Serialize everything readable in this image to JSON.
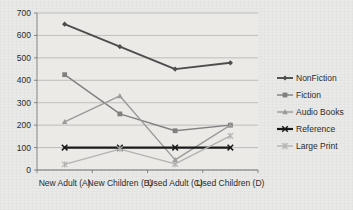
{
  "chart_data": {
    "type": "line",
    "title": "",
    "xlabel": "",
    "ylabel": "",
    "ylim": [
      0,
      700
    ],
    "ytick_step": 100,
    "grid": true,
    "legend_position": "right",
    "categories": [
      "New Adult (A)",
      "New Children (B)",
      "Used Adult (C)",
      "Used Children (D)"
    ],
    "yticks": [
      "0",
      "100",
      "200",
      "300",
      "400",
      "500",
      "600",
      "700"
    ],
    "series": [
      {
        "name": "NonFiction",
        "values": [
          650,
          550,
          450,
          478
        ],
        "color": "#4d4d4d",
        "marker": "diamond",
        "width": 1.9
      },
      {
        "name": "Fiction",
        "values": [
          425,
          250,
          175,
          200
        ],
        "color": "#808080",
        "marker": "square",
        "width": 1.4
      },
      {
        "name": "Audio Books",
        "values": [
          215,
          330,
          45,
          200
        ],
        "color": "#9a9a9a",
        "marker": "triangle",
        "width": 1.4
      },
      {
        "name": "Reference",
        "values": [
          100,
          100,
          100,
          100
        ],
        "color": "#1a1a1a",
        "marker": "x",
        "width": 2.2
      },
      {
        "name": "Large Print",
        "values": [
          25,
          93,
          27,
          152
        ],
        "color": "#b3b3b3",
        "marker": "star",
        "width": 1.4
      }
    ]
  },
  "colors": {
    "background": "#e9e9e7",
    "plot_background": "#eceae7",
    "gridline": "#a9a9a9",
    "axis": "#6e6e6e",
    "text": "#2b2b2b"
  }
}
